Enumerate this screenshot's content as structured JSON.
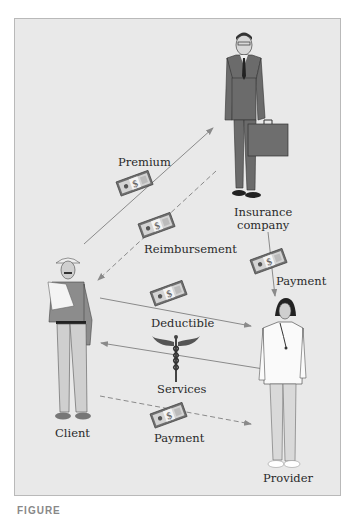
{
  "figure": {
    "actors": {
      "insurance": {
        "label_line1": "Insurance",
        "label_line2": "company"
      },
      "client": {
        "label": "Client"
      },
      "provider": {
        "label": "Provider"
      }
    },
    "flows": [
      {
        "id": "premium",
        "label": "Premium",
        "from": "Client",
        "to": "Insurance company",
        "style": "solid",
        "icon": "money-icon"
      },
      {
        "id": "reimbursement",
        "label": "Reimbursement",
        "from": "Insurance company",
        "to": "Client",
        "style": "dashed",
        "icon": "money-icon"
      },
      {
        "id": "insurer-payment",
        "label": "Payment",
        "from": "Insurance company",
        "to": "Provider",
        "style": "solid",
        "icon": "money-icon"
      },
      {
        "id": "deductible",
        "label": "Deductible",
        "from": "Client",
        "to": "Provider",
        "style": "solid",
        "icon": "money-icon"
      },
      {
        "id": "services",
        "label": "Services",
        "from": "Provider",
        "to": "Client",
        "style": "solid",
        "icon": "caduceus-icon"
      },
      {
        "id": "client-payment",
        "label": "Payment",
        "from": "Client",
        "to": "Provider",
        "style": "dashed",
        "icon": "money-icon"
      }
    ],
    "caption": "FIGURE"
  },
  "colors": {
    "panel_bg": "#e9e9e9",
    "arrow": "#8a8a8a",
    "border": "#b9b9b9"
  }
}
